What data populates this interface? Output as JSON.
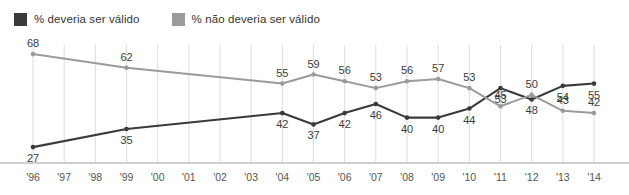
{
  "legend": {
    "items": [
      {
        "label": "% deveria ser válido",
        "color": "#3a3a3a",
        "icon": "legend-swatch-icon"
      },
      {
        "label": "% não deveria ser válido",
        "color": "#9b9b9b",
        "icon": "legend-swatch-icon"
      }
    ]
  },
  "chart_data": {
    "type": "line",
    "title": "",
    "xlabel": "",
    "ylabel": "",
    "grid": true,
    "legend_position": "top-left",
    "ylim": [
      20,
      72
    ],
    "xlim": [
      1996,
      2014
    ],
    "x": [
      1996,
      1997,
      1998,
      1999,
      2000,
      2001,
      2002,
      2003,
      2004,
      2005,
      2006,
      2007,
      2008,
      2009,
      2010,
      2011,
      2012,
      2013,
      2014
    ],
    "tick_labels": [
      "'96",
      "'97",
      "'98",
      "'99",
      "'00",
      "'01",
      "'02",
      "'03",
      "'04",
      "'05",
      "'06",
      "'07",
      "'08",
      "'09",
      "'10",
      "'11",
      "'12",
      "'13",
      "'14"
    ],
    "series": [
      {
        "name": "% deveria ser válido",
        "color": "#3a3a3a",
        "label_position": "below",
        "points": [
          {
            "x": 1996,
            "y": 27,
            "label": "27"
          },
          {
            "x": 1999,
            "y": 35,
            "label": "35"
          },
          {
            "x": 2004,
            "y": 42,
            "label": "42"
          },
          {
            "x": 2005,
            "y": 37,
            "label": "37"
          },
          {
            "x": 2006,
            "y": 42,
            "label": "42"
          },
          {
            "x": 2007,
            "y": 46,
            "label": "46"
          },
          {
            "x": 2008,
            "y": 40,
            "label": "40"
          },
          {
            "x": 2009,
            "y": 40,
            "label": "40"
          },
          {
            "x": 2010,
            "y": 44,
            "label": "44"
          },
          {
            "x": 2011,
            "y": 53,
            "label": "53"
          },
          {
            "x": 2012,
            "y": 48,
            "label": "48"
          },
          {
            "x": 2013,
            "y": 54,
            "label": "54"
          },
          {
            "x": 2014,
            "y": 55,
            "label": "55"
          }
        ]
      },
      {
        "name": "% não deveria ser válido",
        "color": "#9b9b9b",
        "label_position": "above",
        "points": [
          {
            "x": 1996,
            "y": 68,
            "label": "68"
          },
          {
            "x": 1999,
            "y": 62,
            "label": "62"
          },
          {
            "x": 2004,
            "y": 55,
            "label": "55"
          },
          {
            "x": 2005,
            "y": 59,
            "label": "59"
          },
          {
            "x": 2006,
            "y": 56,
            "label": "56"
          },
          {
            "x": 2007,
            "y": 53,
            "label": "53"
          },
          {
            "x": 2008,
            "y": 56,
            "label": "56"
          },
          {
            "x": 2009,
            "y": 57,
            "label": "57"
          },
          {
            "x": 2010,
            "y": 53,
            "label": "53"
          },
          {
            "x": 2011,
            "y": 45,
            "label": "45"
          },
          {
            "x": 2012,
            "y": 50,
            "label": "50"
          },
          {
            "x": 2013,
            "y": 43,
            "label": "43"
          },
          {
            "x": 2014,
            "y": 42,
            "label": "42"
          }
        ]
      }
    ]
  }
}
